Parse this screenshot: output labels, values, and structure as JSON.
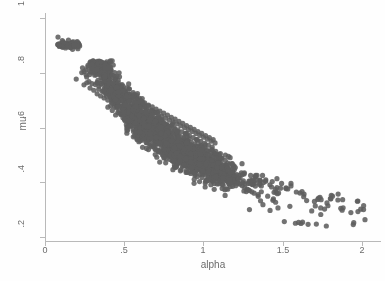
{
  "chart_data": {
    "type": "scatter",
    "title": "",
    "xlabel": "alpha",
    "ylabel": "mu",
    "xlim": [
      0,
      2.12
    ],
    "ylim": [
      0.185,
      1.02
    ],
    "xticks": [
      0,
      0.5,
      1,
      1.5,
      2
    ],
    "xticklabels": [
      "0",
      ".5",
      "1",
      "1.5",
      "2"
    ],
    "yticks": [
      0.2,
      0.4,
      0.6,
      0.8,
      1
    ],
    "yticklabels": [
      ".2",
      ".4",
      ".6",
      ".8",
      "1"
    ],
    "grid": false,
    "legend": null,
    "marker": {
      "shape": "circle",
      "color": "#5f5f5f",
      "size_px": 5.2,
      "opacity": 0.88
    },
    "axis_color": "#b9b9b9",
    "background": "#fefefe",
    "n_points": 1680,
    "clusters": [
      {
        "name": "detached-high-mu",
        "n": 14,
        "x_range": [
          0.07,
          0.22
        ],
        "y_range": [
          0.885,
          0.935
        ]
      },
      {
        "name": "main-band",
        "n": 1590,
        "x_range": [
          0.2,
          1.35
        ],
        "y_range": [
          0.33,
          0.83
        ]
      },
      {
        "name": "right-tail",
        "n": 76,
        "x_range": [
          1.3,
          2.03
        ],
        "y_range": [
          0.235,
          0.4
        ]
      }
    ],
    "points": [
      [
        0.082,
        0.932
      ],
      [
        0.093,
        0.905
      ],
      [
        0.104,
        0.898
      ],
      [
        0.111,
        0.908
      ],
      [
        0.118,
        0.902
      ],
      [
        0.126,
        0.906
      ],
      [
        0.133,
        0.901
      ],
      [
        0.141,
        0.909
      ],
      [
        0.152,
        0.904
      ],
      [
        0.163,
        0.907
      ],
      [
        0.174,
        0.903
      ],
      [
        0.186,
        0.906
      ],
      [
        0.198,
        0.905
      ],
      [
        0.212,
        0.907
      ],
      [
        0.197,
        0.778
      ],
      [
        0.232,
        0.802
      ],
      [
        0.246,
        0.757
      ],
      [
        0.258,
        0.812
      ],
      [
        0.263,
        0.786
      ],
      [
        0.271,
        0.828
      ],
      [
        0.277,
        0.769
      ],
      [
        0.284,
        0.745
      ],
      [
        0.289,
        0.803
      ],
      [
        0.296,
        0.761
      ],
      [
        0.302,
        0.818
      ],
      [
        0.308,
        0.737
      ],
      [
        0.314,
        0.792
      ],
      [
        0.318,
        0.758
      ],
      [
        0.323,
        0.806
      ],
      [
        0.329,
        0.724
      ],
      [
        0.334,
        0.773
      ],
      [
        0.339,
        0.741
      ],
      [
        0.345,
        0.799
      ],
      [
        0.351,
        0.716
      ],
      [
        0.357,
        0.762
      ],
      [
        0.362,
        0.733
      ],
      [
        0.368,
        0.785
      ],
      [
        0.373,
        0.709
      ],
      [
        0.379,
        0.751
      ],
      [
        0.384,
        0.726
      ],
      [
        0.39,
        0.774
      ],
      [
        0.396,
        0.701
      ],
      [
        0.401,
        0.742
      ],
      [
        0.407,
        0.718
      ],
      [
        0.413,
        0.763
      ],
      [
        0.419,
        0.694
      ],
      [
        0.425,
        0.735
      ],
      [
        0.431,
        0.711
      ],
      [
        0.437,
        0.754
      ],
      [
        0.443,
        0.687
      ],
      [
        0.449,
        0.727
      ],
      [
        0.455,
        0.704
      ],
      [
        0.461,
        0.746
      ],
      [
        0.467,
        0.68
      ],
      [
        0.473,
        0.719
      ],
      [
        0.479,
        0.697
      ],
      [
        0.485,
        0.738
      ],
      [
        0.491,
        0.673
      ],
      [
        0.497,
        0.712
      ],
      [
        0.503,
        0.69
      ],
      [
        0.509,
        0.73
      ],
      [
        0.515,
        0.666
      ],
      [
        0.521,
        0.705
      ],
      [
        0.527,
        0.683
      ],
      [
        0.533,
        0.722
      ],
      [
        0.539,
        0.659
      ],
      [
        0.545,
        0.698
      ],
      [
        0.551,
        0.676
      ],
      [
        0.557,
        0.714
      ],
      [
        0.563,
        0.652
      ],
      [
        0.569,
        0.691
      ],
      [
        0.575,
        0.669
      ],
      [
        0.581,
        0.706
      ],
      [
        0.587,
        0.645
      ],
      [
        0.593,
        0.684
      ],
      [
        0.599,
        0.662
      ],
      [
        0.605,
        0.699
      ],
      [
        0.611,
        0.638
      ],
      [
        0.617,
        0.677
      ],
      [
        0.623,
        0.655
      ],
      [
        0.629,
        0.691
      ],
      [
        0.635,
        0.631
      ],
      [
        0.641,
        0.67
      ],
      [
        0.647,
        0.648
      ],
      [
        0.653,
        0.683
      ],
      [
        0.659,
        0.624
      ],
      [
        0.665,
        0.663
      ],
      [
        0.671,
        0.641
      ],
      [
        0.677,
        0.676
      ],
      [
        0.683,
        0.617
      ],
      [
        0.689,
        0.656
      ],
      [
        0.695,
        0.634
      ],
      [
        0.701,
        0.668
      ],
      [
        0.707,
        0.61
      ],
      [
        0.713,
        0.649
      ],
      [
        0.719,
        0.627
      ],
      [
        0.725,
        0.661
      ],
      [
        0.731,
        0.603
      ],
      [
        0.737,
        0.642
      ],
      [
        0.743,
        0.62
      ],
      [
        0.749,
        0.653
      ],
      [
        0.755,
        0.596
      ],
      [
        0.761,
        0.635
      ],
      [
        0.767,
        0.613
      ],
      [
        0.773,
        0.646
      ],
      [
        0.779,
        0.589
      ],
      [
        0.785,
        0.628
      ],
      [
        0.791,
        0.606
      ],
      [
        0.797,
        0.638
      ],
      [
        0.803,
        0.582
      ],
      [
        0.809,
        0.621
      ],
      [
        0.815,
        0.599
      ],
      [
        0.821,
        0.631
      ],
      [
        0.827,
        0.575
      ],
      [
        0.833,
        0.614
      ],
      [
        0.839,
        0.592
      ],
      [
        0.845,
        0.623
      ],
      [
        0.851,
        0.568
      ],
      [
        0.857,
        0.607
      ],
      [
        0.863,
        0.585
      ],
      [
        0.869,
        0.616
      ],
      [
        0.875,
        0.561
      ],
      [
        0.881,
        0.6
      ],
      [
        0.887,
        0.578
      ],
      [
        0.893,
        0.608
      ],
      [
        0.899,
        0.554
      ],
      [
        0.905,
        0.593
      ],
      [
        0.911,
        0.571
      ],
      [
        0.917,
        0.601
      ],
      [
        0.923,
        0.547
      ],
      [
        0.929,
        0.586
      ],
      [
        0.935,
        0.564
      ],
      [
        0.941,
        0.594
      ],
      [
        0.947,
        0.54
      ],
      [
        0.953,
        0.579
      ],
      [
        0.959,
        0.557
      ],
      [
        0.965,
        0.586
      ],
      [
        0.971,
        0.533
      ],
      [
        0.977,
        0.572
      ],
      [
        0.983,
        0.55
      ],
      [
        0.989,
        0.579
      ],
      [
        0.995,
        0.526
      ],
      [
        1.001,
        0.565
      ],
      [
        1.007,
        0.543
      ],
      [
        1.013,
        0.571
      ],
      [
        1.019,
        0.519
      ],
      [
        1.025,
        0.558
      ],
      [
        1.031,
        0.536
      ],
      [
        1.037,
        0.564
      ],
      [
        1.043,
        0.512
      ],
      [
        1.049,
        0.551
      ],
      [
        1.055,
        0.529
      ],
      [
        1.061,
        0.556
      ],
      [
        1.067,
        0.505
      ],
      [
        1.073,
        0.544
      ],
      [
        1.079,
        0.478
      ],
      [
        1.085,
        0.498
      ],
      [
        1.091,
        0.462
      ],
      [
        1.097,
        0.487
      ],
      [
        1.11,
        0.451
      ],
      [
        1.125,
        0.443
      ],
      [
        1.14,
        0.435
      ],
      [
        1.155,
        0.428
      ],
      [
        1.17,
        0.42
      ],
      [
        1.185,
        0.413
      ],
      [
        1.2,
        0.406
      ],
      [
        1.215,
        0.399
      ],
      [
        1.23,
        0.393
      ],
      [
        1.245,
        0.387
      ],
      [
        1.26,
        0.381
      ],
      [
        1.275,
        0.375
      ],
      [
        1.29,
        0.37
      ],
      [
        1.305,
        0.365
      ],
      [
        1.32,
        0.36
      ],
      [
        1.29,
        0.3
      ],
      [
        1.31,
        0.392
      ],
      [
        1.335,
        0.408
      ],
      [
        1.345,
        0.355
      ],
      [
        1.36,
        0.332
      ],
      [
        1.375,
        0.318
      ],
      [
        1.392,
        0.404
      ],
      [
        1.405,
        0.349
      ],
      [
        1.42,
        0.297
      ],
      [
        1.438,
        0.334
      ],
      [
        1.455,
        0.327
      ],
      [
        1.47,
        0.306
      ],
      [
        1.51,
        0.256
      ],
      [
        1.545,
        0.312
      ],
      [
        1.58,
        0.25
      ],
      [
        1.6,
        0.253
      ],
      [
        1.615,
        0.249
      ],
      [
        1.625,
        0.254
      ],
      [
        1.66,
        0.246
      ],
      [
        1.7,
        0.33
      ],
      [
        1.712,
        0.247
      ],
      [
        1.74,
        0.282
      ],
      [
        1.775,
        0.24
      ],
      [
        1.93,
        0.289
      ],
      [
        1.945,
        0.245
      ],
      [
        1.948,
        0.252
      ],
      [
        2.01,
        0.3
      ]
    ]
  },
  "axes": {
    "y_title": "mu",
    "x_title": "alpha"
  }
}
